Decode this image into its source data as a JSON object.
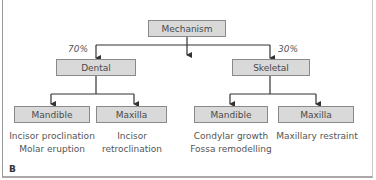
{
  "diagram": {
    "root": "Mechanism",
    "left": {
      "label": "Dental",
      "percent": "70%",
      "children": [
        {
          "label": "Mandible",
          "description": [
            "Incisor proclination",
            "Molar eruption"
          ]
        },
        {
          "label": "Maxilla",
          "description": [
            "Incisor",
            "retroclination"
          ]
        }
      ]
    },
    "right": {
      "label": "Skeletal",
      "percent": "30%",
      "children": [
        {
          "label": "Mandible",
          "description": [
            "Condylar growth",
            "Fossa remodelling"
          ]
        },
        {
          "label": "Maxilla",
          "description": [
            "Maxillary restraint"
          ]
        }
      ]
    },
    "panel_label": "B"
  },
  "colors": {
    "box_fill": "#d9d9d9",
    "box_border": "#8a8a8a",
    "line": "#333333"
  }
}
